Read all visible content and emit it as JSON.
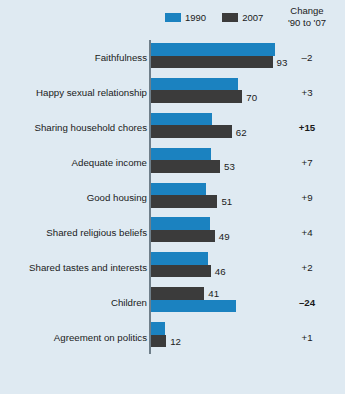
{
  "legend": {
    "entries": [
      {
        "label": "1990",
        "color": "#1b82c0",
        "icon": "legend-swatch-1990"
      },
      {
        "label": "2007",
        "color": "#3b3b3b",
        "icon": "legend-swatch-2007"
      }
    ]
  },
  "change_header": {
    "line1": "Change",
    "line2": "'90 to '07"
  },
  "chart_data": {
    "type": "bar",
    "orientation": "horizontal",
    "title": "",
    "subtitle": "",
    "xlabel": "",
    "ylabel": "",
    "xlim": [
      0,
      100
    ],
    "grid": false,
    "legend_position": "top",
    "categories": [
      "Faithfulness",
      "Happy sexual relationship",
      "Sharing household chores",
      "Adequate income",
      "Good housing",
      "Shared religious beliefs",
      "Shared tastes and interests",
      "Children",
      "Agreement on politics"
    ],
    "series": [
      {
        "name": "1990",
        "color": "#1b82c0",
        "values": [
          95,
          67,
          47,
          46,
          42,
          45,
          44,
          65,
          11
        ]
      },
      {
        "name": "2007",
        "color": "#3b3b3b",
        "values": [
          93,
          70,
          62,
          53,
          51,
          49,
          46,
          41,
          12
        ]
      }
    ],
    "value_labels": {
      "series": "2007",
      "values": [
        93,
        70,
        62,
        53,
        51,
        49,
        46,
        41,
        12
      ]
    },
    "change_column": {
      "header": "Change '90 to '07",
      "values": [
        "–2",
        "+3",
        "+15",
        "+7",
        "+9",
        "+4",
        "+2",
        "–24",
        "+1"
      ],
      "emphasized": [
        false,
        false,
        true,
        false,
        false,
        false,
        false,
        true,
        false
      ]
    },
    "row_order_note": [
      "1990-top",
      "1990-top",
      "1990-top",
      "1990-top",
      "1990-top",
      "1990-top",
      "1990-top",
      "2007-top",
      "1990-top"
    ]
  },
  "style": {
    "background": "#dfeaf2",
    "axis_color": "#6f7f8a",
    "text_color": "#1a1a1a"
  }
}
